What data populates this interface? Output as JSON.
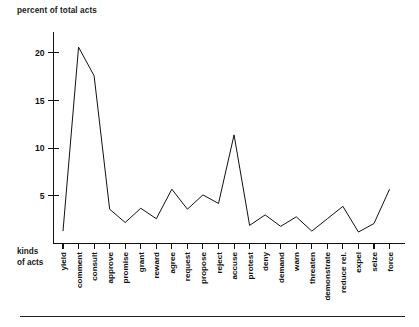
{
  "figure": {
    "y_axis_title": "percent of total acts",
    "x_axis_title_line1": "kinds",
    "x_axis_title_line2": "of acts"
  },
  "chart_data": {
    "type": "line",
    "title": "",
    "subtitle": "",
    "xlabel": "kinds of acts",
    "ylabel": "percent of total acts",
    "grid": false,
    "legend": false,
    "ylim": [
      0,
      22
    ],
    "yticks": [
      5,
      10,
      15,
      20
    ],
    "ytick_labels": [
      "5",
      "10",
      "15",
      "20"
    ],
    "categories": [
      "yield",
      "comment",
      "consult",
      "approve",
      "promise",
      "grant",
      "reward",
      "agree",
      "request",
      "propose",
      "reject",
      "accuse",
      "protest",
      "deny",
      "demand",
      "warn",
      "threaten",
      "demonstrate",
      "reduce rel.",
      "expel",
      "seize",
      "force"
    ],
    "values": [
      1.3,
      20.6,
      17.6,
      3.6,
      2.2,
      3.7,
      2.6,
      5.7,
      3.6,
      5.1,
      4.2,
      11.4,
      1.9,
      3.0,
      1.8,
      2.8,
      1.3,
      2.6,
      3.9,
      1.2,
      2.1,
      5.7
    ]
  }
}
